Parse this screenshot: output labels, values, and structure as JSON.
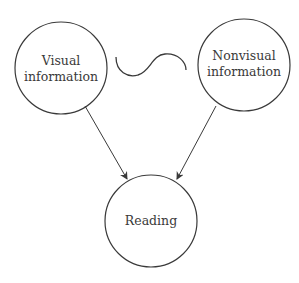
{
  "diagram": {
    "nodes": [
      {
        "id": "visual",
        "lines": [
          "Visual",
          "information"
        ],
        "cx": 61,
        "cy": 68,
        "r": 46
      },
      {
        "id": "nonvisual",
        "lines": [
          "Nonvisual",
          "information"
        ],
        "cx": 244,
        "cy": 65,
        "r": 46
      },
      {
        "id": "reading",
        "lines": [
          "Reading"
        ],
        "cx": 151,
        "cy": 221,
        "r": 46
      }
    ],
    "edges": [
      {
        "from": "visual",
        "to": "reading"
      },
      {
        "from": "nonvisual",
        "to": "reading"
      }
    ],
    "connector": "wave",
    "colors": {
      "stroke": "#3a3a3a",
      "text": "#3a3a3a",
      "background": "#ffffff"
    }
  }
}
